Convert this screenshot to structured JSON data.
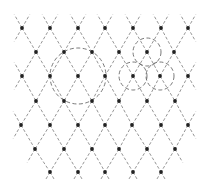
{
  "diagram": {
    "title": "",
    "colors": {
      "background": "#ffffff",
      "line": "#8a8a8a",
      "circle": "#6a6a6a",
      "dot": "#222222"
    },
    "lattice": {
      "dx": 27.7,
      "dy": 24.2,
      "extension": 0.55,
      "rows": [
        {
          "y": 28,
          "xs": [
            22,
            50,
            78,
            105,
            133,
            161,
            188
          ]
        },
        {
          "y": 52,
          "xs": [
            36,
            64,
            92,
            119,
            147,
            174
          ]
        },
        {
          "y": 76,
          "xs": [
            22,
            50,
            78,
            105,
            133,
            160,
            188
          ]
        },
        {
          "y": 101,
          "xs": [
            36,
            64,
            92,
            119,
            147,
            175
          ]
        },
        {
          "y": 125,
          "xs": [
            21,
            50,
            78,
            105,
            132,
            161,
            188
          ]
        },
        {
          "y": 149,
          "xs": [
            35,
            64,
            92,
            119,
            147,
            175
          ]
        },
        {
          "y": 172,
          "xs": [
            50,
            78,
            105,
            133,
            161
          ]
        }
      ]
    },
    "circles": [
      {
        "name": "large-circle",
        "cx": 78,
        "cy": 76,
        "r": 28
      },
      {
        "name": "small-circle-top",
        "cx": 147,
        "cy": 52,
        "r": 14
      },
      {
        "name": "small-circle-left",
        "cx": 133,
        "cy": 76,
        "r": 14
      },
      {
        "name": "small-circle-right",
        "cx": 160,
        "cy": 76,
        "r": 14
      }
    ]
  }
}
